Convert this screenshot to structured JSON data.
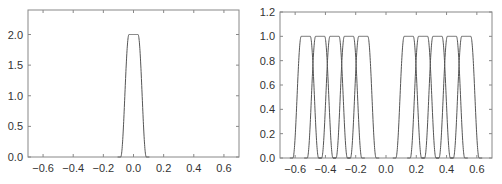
{
  "chart_data": [
    {
      "type": "line",
      "title": "",
      "xlabel": "",
      "ylabel": "",
      "xlim": [
        -0.7,
        0.7
      ],
      "ylim": [
        0,
        2.4
      ],
      "xticks": [
        "-0.6",
        "-0.4",
        "-0.2",
        "0.0",
        "0.2",
        "0.4",
        "0.6"
      ],
      "yticks": [
        "0.0",
        "0.5",
        "1.0",
        "1.5",
        "2.0"
      ],
      "grid": false,
      "legend": null,
      "series": [
        {
          "name": "pulse",
          "center": 0.0,
          "height": 2.0,
          "half_width_top": 0.03,
          "half_width_base": 0.085
        }
      ]
    },
    {
      "type": "line",
      "title": "",
      "xlabel": "",
      "ylabel": "",
      "xlim": [
        -0.7,
        0.7
      ],
      "ylim": [
        0,
        1.2
      ],
      "xticks": [
        "-0.6",
        "-0.4",
        "-0.2",
        "0.0",
        "0.2",
        "0.4",
        "0.6"
      ],
      "yticks": [
        "0.0",
        "0.2",
        "0.4",
        "0.6",
        "0.8",
        "1.0",
        "1.2"
      ],
      "grid": false,
      "legend": null,
      "series": [
        {
          "name": "pulse-1",
          "center": -0.53,
          "height": 1.0
        },
        {
          "name": "pulse-2",
          "center": -0.435,
          "height": 1.0
        },
        {
          "name": "pulse-3",
          "center": -0.34,
          "height": 1.0
        },
        {
          "name": "pulse-4",
          "center": -0.245,
          "height": 1.0
        },
        {
          "name": "pulse-5",
          "center": -0.15,
          "height": 1.0
        },
        {
          "name": "pulse-6",
          "center": 0.15,
          "height": 1.0
        },
        {
          "name": "pulse-7",
          "center": 0.245,
          "height": 1.0
        },
        {
          "name": "pulse-8",
          "center": 0.34,
          "height": 1.0
        },
        {
          "name": "pulse-9",
          "center": 0.435,
          "height": 1.0
        },
        {
          "name": "pulse-10",
          "center": 0.53,
          "height": 1.0
        }
      ],
      "pulse_half_width_top": 0.03,
      "pulse_half_width_base": 0.085
    }
  ],
  "colors": {
    "line": "#555555",
    "frame": "#888888",
    "text": "#333333"
  }
}
